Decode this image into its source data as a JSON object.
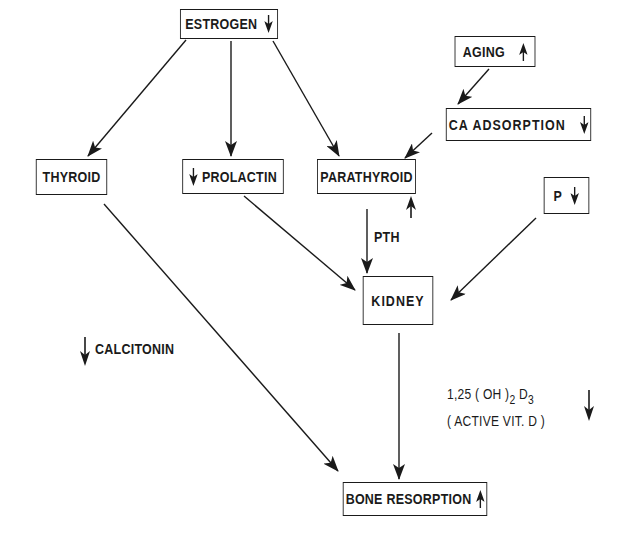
{
  "diagram": {
    "type": "flowchart",
    "nodes": {
      "estrogen": {
        "label": "ESTROGEN",
        "indicator": "down"
      },
      "aging": {
        "label": "AGING",
        "indicator": "up"
      },
      "ca_adsorption": {
        "label": "CA ADSORPTION",
        "indicator": "down"
      },
      "thyroid": {
        "label": "THYROID"
      },
      "prolactin": {
        "label": "PROLACTIN",
        "indicator": "down",
        "indicator_position": "left"
      },
      "parathyroid": {
        "label": "PARATHYROID"
      },
      "p": {
        "label": "P",
        "indicator": "down"
      },
      "kidney": {
        "label": "KIDNEY"
      },
      "bone_resorption": {
        "label": "BONE RESORPTION",
        "indicator": "up"
      }
    },
    "free_labels": {
      "pth": "PTH",
      "pth_indicator": "up",
      "calcitonin": "CALCITONIN",
      "calcitonin_indicator": "down",
      "vitd_prefix": "1,25 ( OH )",
      "vitd_sub1": "2",
      "vitd_mid": " D",
      "vitd_sub2": "3",
      "vitd_line2": "( ACTIVE VIT. D )",
      "vitd_indicator": "down"
    },
    "edges": [
      {
        "from": "ESTROGEN",
        "to": "THYROID"
      },
      {
        "from": "ESTROGEN",
        "to": "PROLACTIN"
      },
      {
        "from": "ESTROGEN",
        "to": "PARATHYROID"
      },
      {
        "from": "AGING",
        "to": "CA ADSORPTION"
      },
      {
        "from": "CA ADSORPTION",
        "to": "PARATHYROID"
      },
      {
        "from": "PARATHYROID",
        "to": "KIDNEY",
        "label": "PTH"
      },
      {
        "from": "PROLACTIN",
        "to": "KIDNEY"
      },
      {
        "from": "P",
        "to": "KIDNEY"
      },
      {
        "from": "THYROID",
        "to": "BONE RESORPTION"
      },
      {
        "from": "KIDNEY",
        "to": "BONE RESORPTION"
      }
    ],
    "colors": {
      "ink": "#1a1a1a",
      "background": "#ffffff"
    }
  }
}
